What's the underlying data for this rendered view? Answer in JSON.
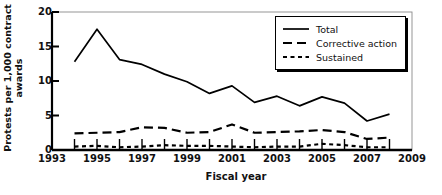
{
  "chart_data": {
    "type": "line",
    "title": "",
    "xlabel": "Fiscal year",
    "ylabel": "Protests per 1,000 contract awards",
    "ylabel_line1": "Protests per 1,000 contract",
    "ylabel_line2": "awards",
    "xlim": [
      1993,
      2009
    ],
    "ylim": [
      0,
      20
    ],
    "ytick_labels": [
      "0",
      "5",
      "10",
      "15",
      "20"
    ],
    "ytick_values": [
      0,
      5,
      10,
      15,
      20
    ],
    "xtick_labels": [
      "1993",
      "1995",
      "1997",
      "1999",
      "2001",
      "2003",
      "2005",
      "2007",
      "2009"
    ],
    "xtick_values": [
      1993,
      1995,
      1997,
      1999,
      2001,
      2003,
      2005,
      2007,
      2009
    ],
    "minor_xticks": [
      1994,
      1996,
      1998,
      2000,
      2002,
      2004,
      2006,
      2008
    ],
    "grid": false,
    "legend_position": "upper-right",
    "x": [
      1994,
      1995,
      1996,
      1997,
      1998,
      1999,
      2000,
      2001,
      2002,
      2003,
      2004,
      2005,
      2006,
      2007,
      2008
    ],
    "series": [
      {
        "name": "Total",
        "style": "solid",
        "values": [
          12.8,
          17.5,
          13.1,
          12.4,
          11.0,
          9.9,
          8.2,
          9.3,
          6.9,
          7.8,
          6.4,
          7.7,
          6.8,
          4.2,
          5.2
        ]
      },
      {
        "name": "Corrective action",
        "style": "dashed",
        "values": [
          2.4,
          2.5,
          2.6,
          3.3,
          3.2,
          2.5,
          2.6,
          3.7,
          2.5,
          2.6,
          2.7,
          2.9,
          2.6,
          1.6,
          1.8
        ]
      },
      {
        "name": "Sustained",
        "style": "dotted",
        "values": [
          0.5,
          0.6,
          0.4,
          0.5,
          0.7,
          0.6,
          0.6,
          0.5,
          0.4,
          0.5,
          0.5,
          0.9,
          0.7,
          0.4,
          0.4
        ]
      }
    ]
  },
  "legend": {
    "items": [
      {
        "label": "Total",
        "style": "solid"
      },
      {
        "label": "Corrective action",
        "style": "dashed"
      },
      {
        "label": "Sustained",
        "style": "dotted"
      }
    ]
  },
  "colors": {
    "line": "#000000",
    "axis": "#000000",
    "background": "#ffffff"
  }
}
